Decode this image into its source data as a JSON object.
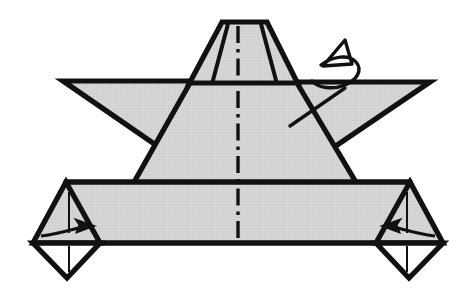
{
  "figure": {
    "width": 475,
    "height": 307,
    "background_color": "#ffffff"
  },
  "style": {
    "paper_fill": "#d2d2d2",
    "paper_fill_light": "#d8d8d8",
    "paper_back_fill": "#ffffff",
    "ink_color": "#111111",
    "outline_width": 5.2,
    "crease_width": 3.4,
    "thin_width": 2.0,
    "arrow_width": 3.0,
    "center_line_width": 3.2
  },
  "shapes": {
    "top_flap": {
      "name": "top-trapezoid-flap",
      "points": "222,22 267,22 297,82 190,82",
      "fill": "#d2d2d2"
    },
    "top_flap_left_crease": {
      "name": "top-flap-left-crease",
      "points": "228,23 213,82"
    },
    "top_flap_right_crease": {
      "name": "top-flap-right-crease",
      "points": "262,23 278,82"
    },
    "left_point": {
      "name": "left-side-point",
      "points": "63,81 196,81 160,148",
      "fill": "#d2d2d2"
    },
    "right_point": {
      "name": "right-side-point",
      "points": "430,82 293,82 330,150",
      "fill": "#d2d2d2"
    },
    "body": {
      "name": "body-trapezoid",
      "points": "191,82 296,82 356,183 134,183",
      "fill": "#d2d2d2"
    },
    "bottom_band": {
      "name": "bottom-band",
      "points": "66,182 410,182 424,243 52,243",
      "fill": "#d2d2d2"
    },
    "bottom_left_flap": {
      "name": "bottom-left-corner-flap",
      "points": "66,182 33,243 100,243",
      "fill": "#d2d2d2"
    },
    "bottom_right_flap": {
      "name": "bottom-right-corner-flap",
      "points": "410,182 443,243 376,243",
      "fill": "#d2d2d2"
    },
    "bottom_left_tip": {
      "name": "bottom-left-white-tip",
      "points": "33,243 100,243 67,278",
      "fill": "#ffffff"
    },
    "bottom_right_tip": {
      "name": "bottom-right-white-tip",
      "points": "443,243 376,243 409,278",
      "fill": "#ffffff"
    }
  },
  "creases": {
    "center_mountain_line": {
      "name": "center-mountain-fold-line",
      "label": "mountain fold (dash-dot)",
      "dash_pattern": "16 6 3 6",
      "x": 238,
      "y_top": 26,
      "y_bottom": 240
    },
    "band_top_edge": {
      "name": "band-top-edge-crease",
      "points": "66,182 410,182"
    },
    "body_left_edge": {
      "name": "body-left-edge-crease",
      "points": "191,82 134,183"
    },
    "body_right_edge": {
      "name": "body-right-edge-crease",
      "points": "296,82 356,183"
    },
    "horizon_line": {
      "name": "wing-horizon-crease",
      "points": "63,81 430,82"
    }
  },
  "arrows": [
    {
      "name": "fold-arrow-left",
      "label": "fold left flap to the right",
      "direction": "right",
      "shaft_start_x": 41,
      "shaft_start_y": 235,
      "shaft_end_x": 88,
      "shaft_end_y": 226,
      "head_x": 92,
      "head_y": 226
    },
    {
      "name": "fold-arrow-right",
      "label": "fold right flap to the left",
      "direction": "left",
      "shaft_start_x": 435,
      "shaft_start_y": 235,
      "shaft_end_x": 388,
      "shaft_end_y": 226,
      "head_x": 384,
      "head_y": 226
    },
    {
      "name": "turn-over-arrow",
      "label": "turn the model over",
      "direction": "loop-up-left",
      "description": "curled arrow indicating the model is flipped over"
    }
  ],
  "alignment_ticks": [
    {
      "name": "tick-left-upper",
      "points": "69,192 69,232"
    },
    {
      "name": "tick-left-lower",
      "points": "69,245 69,272"
    },
    {
      "name": "tick-right-upper",
      "points": "407,192 407,232"
    },
    {
      "name": "tick-right-lower",
      "points": "407,245 407,272"
    }
  ]
}
